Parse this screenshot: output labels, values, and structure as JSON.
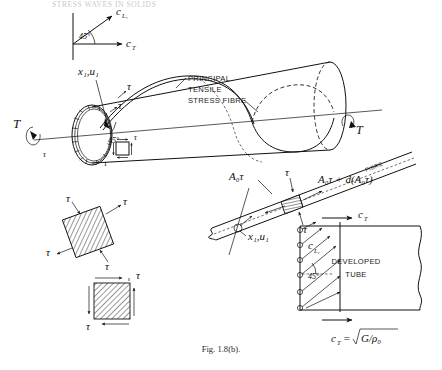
{
  "page": {
    "running_head": "STRESS WAVES IN SOLIDS",
    "caption": "Fig. 1.8(b)."
  },
  "axes_inset": {
    "name": "wave-speed-axes",
    "vertical_axis_label": "c",
    "vertical_axis_sub": "L₁",
    "horizontal_axis_label": "c",
    "horizontal_axis_sub": "T",
    "angle": "45°"
  },
  "cylinder": {
    "name": "torsion-tube",
    "coordinate_label": "x₁,u₁",
    "torque_left": "T",
    "torque_right": "T",
    "shear_left_ring": "τ",
    "shear_helix_upper": "τ",
    "shear_helix_lower": "τ",
    "helix_angle": "45°",
    "fibre_label_lines": [
      "PRINCIPAL",
      "TENSILE",
      "STRESS FIBRE"
    ],
    "element_shear_top": "τ",
    "element_shear_right": "τ",
    "element_shear_bottom": "τ",
    "element_shear_left": "τ"
  },
  "stress_elements": {
    "rotated": {
      "name": "principal-stress-element",
      "labels": [
        "τ",
        "τ",
        "τ",
        "τ"
      ]
    },
    "aligned": {
      "name": "shear-stress-element",
      "labels": [
        "τ",
        "τ"
      ]
    }
  },
  "fibre_element": {
    "name": "fibre-free-body",
    "force_left": "A₀τ",
    "force_right": "A₀τ + d(A₀τ)",
    "fibre_label": "FIBRE",
    "coordinate_label": "x₁,u₁",
    "shear_top": "τ",
    "shear_bottom": "τ"
  },
  "developed_tube": {
    "name": "developed-tube-panel",
    "title_line1": "DEVELOPED",
    "title_line2": "TUBE",
    "axis_top_label": "c",
    "axis_top_sub": "T",
    "diagonal_label": "c",
    "diagonal_sub": "L₁",
    "angle": "45°",
    "formula": "c",
    "formula_sub": "T",
    "formula_rest": "=",
    "formula_radicand": "G/ρ₀"
  },
  "colors": {
    "ink": "#111111",
    "hatch": "#6b6b6b",
    "header_faded": "#c9c9c9",
    "background": "#ffffff"
  }
}
